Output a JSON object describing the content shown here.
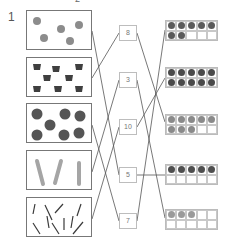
{
  "exercise": {
    "number": "1",
    "top_mark": "2"
  },
  "pictures": [
    {
      "label": "balls",
      "count": 5
    },
    {
      "label": "cups",
      "count": 9
    },
    {
      "label": "apples",
      "count": 7
    },
    {
      "label": "candles",
      "count": 3
    },
    {
      "label": "pins",
      "count": 10
    }
  ],
  "numbers": [
    "8",
    "3",
    "10",
    "5",
    "7"
  ],
  "ten_frames": [
    {
      "filled": 7,
      "color": "#5a5a5a"
    },
    {
      "filled": 10,
      "color": "#4a4a4a"
    },
    {
      "filled": 8,
      "color": "#8a8a8a"
    },
    {
      "filled": 5,
      "color": "#4f4f4f"
    },
    {
      "filled": 3,
      "color": "#9a9a9a"
    }
  ],
  "matches": {
    "picture_to_number": [
      [
        0,
        3
      ],
      [
        1,
        0
      ],
      [
        2,
        4
      ],
      [
        3,
        1
      ],
      [
        4,
        2
      ]
    ],
    "number_to_frame": [
      [
        0,
        2
      ],
      [
        1,
        4
      ],
      [
        2,
        1
      ],
      [
        3,
        3
      ],
      [
        4,
        0
      ]
    ]
  },
  "colors": {
    "line": "#555555",
    "box_border": "#777777",
    "ball": "#8c8c8c",
    "cup": "#3f3f3f",
    "apple": "#555555",
    "candle": "#a5a5a5",
    "pin": "#3a3a3a"
  }
}
